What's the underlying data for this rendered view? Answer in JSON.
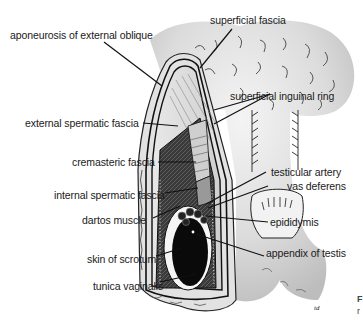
{
  "figure": {
    "type": "anatomical-diagram",
    "signature": "td"
  },
  "labels": {
    "aponeurosis": "aponeurosis of external oblique",
    "superficial_fascia": "superficial fascia",
    "superficial_inguinal_ring": "superficial inguinal ring",
    "external_spermatic_fascia": "external spermatic fascia",
    "cremasteric_fascia": "cremasteric fascia",
    "internal_spermatic_fascia": "internal spermatic fascia",
    "testicular_artery": "testicular artery",
    "vas_deferens": "vas deferens",
    "dartos_muscle": "dartos muscle",
    "epididymis": "epididymis",
    "skin_of_scrotum": "skin of scrotum",
    "appendix_of_testis": "appendix of testis",
    "tunica_vaginalis": "tunica vaginalis"
  },
  "cropped_text": {
    "line1": "F",
    "line2": "r"
  },
  "colors": {
    "background": "#ffffff",
    "skin_shade": "#d9d9d9",
    "ink": "#111111",
    "testis": "#0a0a0a",
    "label_text": "#1a1a1a"
  }
}
